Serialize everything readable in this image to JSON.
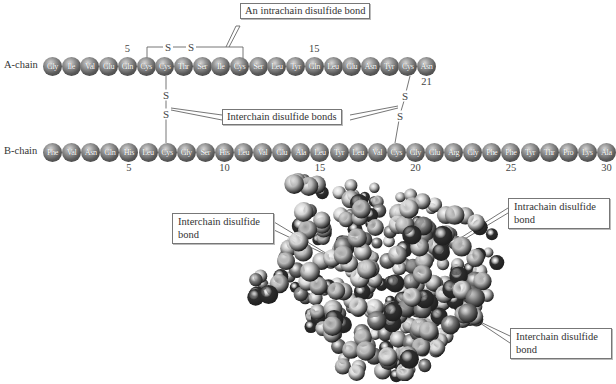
{
  "figure": {
    "a_chain": {
      "label": "A-chain",
      "residues": [
        "Gly",
        "Ile",
        "Val",
        "Glu",
        "Gln",
        "Cys",
        "Cys",
        "Thr",
        "Ser",
        "Ile",
        "Cys",
        "Ser",
        "Leu",
        "Tyr",
        "Gln",
        "Leu",
        "Glu",
        "Asn",
        "Tyr",
        "Cys",
        "Asn"
      ],
      "position_markers": [
        {
          "index": 5,
          "label": "5"
        },
        {
          "index": 15,
          "label": "15"
        },
        {
          "index": 21,
          "label": "21"
        }
      ]
    },
    "b_chain": {
      "label": "B-chain",
      "residues": [
        "Phe",
        "Val",
        "Asn",
        "Gln",
        "His",
        "Leu",
        "Cys",
        "Gly",
        "Ser",
        "His",
        "Leu",
        "Val",
        "Glu",
        "Ala",
        "Leu",
        "Tyr",
        "Leu",
        "Val",
        "Cys",
        "Gly",
        "Glu",
        "Arg",
        "Gly",
        "Phe",
        "Phe",
        "Tyr",
        "Thr",
        "Pro",
        "Lys",
        "Ala"
      ],
      "position_markers": [
        {
          "index": 5,
          "label": "5"
        },
        {
          "index": 10,
          "label": "10"
        },
        {
          "index": 15,
          "label": "15"
        },
        {
          "index": 20,
          "label": "20"
        },
        {
          "index": 25,
          "label": "25"
        },
        {
          "index": 30,
          "label": "30"
        }
      ]
    },
    "sulfur_symbol": "S",
    "bond_symbol": "—",
    "callouts": {
      "intrachain_top": "An intrachain disulfide bond",
      "interchain_top": "Interchain disulfide bonds",
      "model_interchain_left": "Interchain disulfide bond",
      "model_intrachain_right": "Intrachain disulfide bond",
      "model_interchain_bottom": "Interchain disulfide bond"
    },
    "model": {
      "description": "space-filling molecular model",
      "colors": {
        "dark": "#2e2e2e",
        "mid": "#7a7a7a",
        "light": "#b8b8b8",
        "pale": "#d4d4d4"
      }
    }
  }
}
